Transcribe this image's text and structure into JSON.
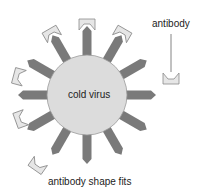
{
  "diagram": {
    "center_label": "cold virus",
    "callout_label": "antibody",
    "caption": "antibody shape fits",
    "colors": {
      "virus_fill": "#dcdcdc",
      "virus_stroke": "#9a9a9a",
      "spike": "#7a7a7a",
      "antibody_fill": "#e6e6e6",
      "antibody_stroke": "#8a8a8a",
      "leader_line": "#666666"
    },
    "virus": {
      "cx": 87,
      "cy": 95,
      "r": 40
    },
    "spikes_deg": [
      -90,
      -60,
      -30,
      0,
      30,
      60,
      90,
      120,
      150,
      180,
      210,
      240
    ],
    "bound_antibodies_deg": [
      -90,
      -60,
      -120,
      195,
      160
    ],
    "free_antibodies": [
      {
        "x": 171,
        "y": 78,
        "rot": 90
      },
      {
        "x": 38,
        "y": 165,
        "rot": 125
      }
    ]
  }
}
